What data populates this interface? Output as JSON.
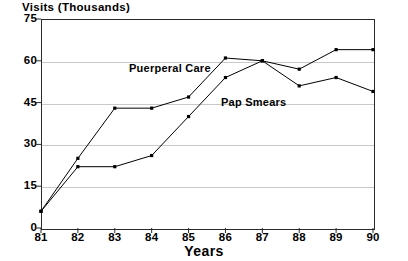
{
  "chart_data": {
    "type": "line",
    "title": "Visits (Thousands)",
    "xlabel": "Years",
    "ylabel": "Visits (Thousands)",
    "x": [
      "81",
      "82",
      "83",
      "84",
      "85",
      "86",
      "87",
      "88",
      "89",
      "90"
    ],
    "categories": [
      "81",
      "82",
      "83",
      "84",
      "85",
      "86",
      "87",
      "88",
      "89",
      "90"
    ],
    "xlim": [
      81,
      90
    ],
    "ylim": [
      0,
      75
    ],
    "yticks": [
      0,
      15,
      30,
      45,
      60,
      75
    ],
    "ytick_labels": [
      "0",
      "15",
      "30",
      "45",
      "60",
      "75"
    ],
    "xtick_labels": [
      "81",
      "82",
      "83",
      "84",
      "85",
      "86",
      "87",
      "88",
      "89",
      "90"
    ],
    "grid": "horizontal",
    "legend_position": "inline-annotations",
    "markers": "small-filled-square",
    "series": [
      {
        "name": "Puerperal Care",
        "color": "#000000",
        "label_x": "85",
        "values": [
          6,
          25,
          43,
          43,
          47,
          61,
          60,
          57,
          64,
          64
        ]
      },
      {
        "name": "Pap Smears",
        "color": "#000000",
        "label_x": "86",
        "values": [
          6,
          22,
          22,
          26,
          40,
          54,
          60,
          51,
          54,
          49
        ]
      }
    ]
  },
  "axes": {
    "frame_color": "#2b2b2b",
    "grid_color": "#c9c9c9",
    "background": "#ffffff"
  }
}
